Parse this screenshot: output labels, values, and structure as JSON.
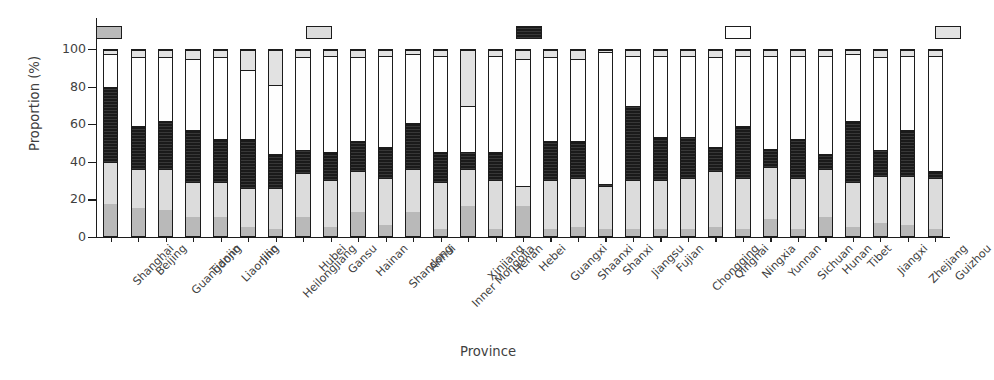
{
  "chart_data": {
    "type": "bar",
    "subtype": "stacked-bar-100-percent",
    "title": "",
    "xlabel": "Province",
    "ylabel": "Proportion (%)",
    "ylim": [
      0,
      100
    ],
    "yticks": [
      0,
      20,
      40,
      60,
      80,
      100
    ],
    "grid": false,
    "legend_position": "top",
    "stacked": true,
    "stack_order": "bottom-to-top",
    "categories": [
      "Shanghai",
      "Beijing",
      "Guangdong",
      "Tianjin",
      "Liaoning",
      "Jilin",
      "Heilongjiang",
      "Hubei",
      "Gansu",
      "Hainan",
      "Shandong",
      "Anhui",
      "Inner Mongolia",
      "Xinjiang",
      "Henan",
      "Hebei",
      "Guangxi",
      "Shaanxi",
      "Shanxi",
      "Jiangsu",
      "Fujian",
      "Chongqing",
      "Qinghai",
      "Ningxia",
      "Yunnan",
      "Sichuan",
      "Hunan",
      "Tibet",
      "Jiangxi",
      "Zhejiang",
      "Guizhou"
    ],
    "series": [
      {
        "name": "Stable urban activity",
        "color": "#b9b9b9",
        "fill": "solid-gray",
        "values": [
          17,
          15,
          14,
          10,
          10,
          5,
          4,
          10,
          5,
          13,
          6,
          13,
          4,
          16,
          4,
          16,
          4,
          5,
          4,
          4,
          4,
          4,
          5,
          4,
          9,
          4,
          10,
          5,
          7,
          6,
          4
        ]
      },
      {
        "name": "High-level steady growth",
        "color": "#dcdcdc",
        "fill": "light-gray",
        "values": [
          23,
          21,
          22,
          19,
          19,
          21,
          22,
          24,
          25,
          22,
          25,
          23,
          25,
          20,
          26,
          11,
          26,
          26,
          23,
          26,
          26,
          27,
          30,
          27,
          28,
          27,
          26,
          24,
          25,
          26,
          27
        ]
      },
      {
        "name": "Acceleration",
        "color": "#1a1a1a",
        "fill": "dark-hatched",
        "values": [
          40,
          23,
          26,
          28,
          23,
          26,
          18,
          12,
          15,
          16,
          17,
          25,
          16,
          9,
          15,
          0,
          21,
          20,
          1,
          40,
          23,
          22,
          13,
          28,
          10,
          21,
          8,
          33,
          14,
          25,
          4
        ]
      },
      {
        "name": "Low-level steady growth",
        "color": "#fefefe",
        "fill": "white",
        "values": [
          18,
          37,
          34,
          38,
          44,
          37,
          37,
          50,
          52,
          45,
          49,
          37,
          52,
          25,
          52,
          68,
          45,
          44,
          71,
          27,
          44,
          44,
          48,
          38,
          50,
          45,
          53,
          36,
          50,
          40,
          62
        ]
      },
      {
        "name": "Fluctuation",
        "color": "#e2e2e2",
        "fill": "pale-gray",
        "values": [
          2,
          4,
          4,
          5,
          4,
          11,
          19,
          4,
          3,
          4,
          3,
          2,
          3,
          30,
          3,
          5,
          4,
          5,
          1,
          3,
          3,
          3,
          4,
          3,
          3,
          3,
          3,
          2,
          4,
          3,
          3
        ]
      }
    ]
  },
  "legend": {
    "items": [
      {
        "label": "Stable urban activity",
        "cls": "f-stable"
      },
      {
        "label": "High-level steady growth",
        "cls": "f-high"
      },
      {
        "label": "Acceleration",
        "cls": "f-accel"
      },
      {
        "label": "Low-level steady growth",
        "cls": "f-low"
      },
      {
        "label": "Fluctuation",
        "cls": "f-fluct"
      }
    ]
  }
}
